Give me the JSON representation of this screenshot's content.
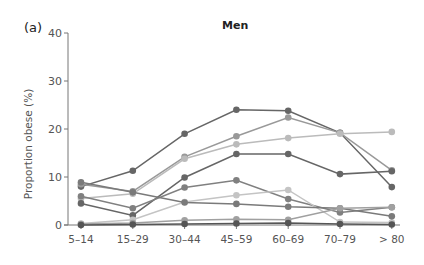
{
  "panel_label": "(a)",
  "chart_data": {
    "type": "line",
    "title": "Men",
    "xlabel": "",
    "ylabel": "Proportion obese (%)",
    "ylim": [
      0,
      40
    ],
    "yticks": [
      0,
      10,
      20,
      30,
      40
    ],
    "grid": false,
    "legend": null,
    "categories": [
      "5–14",
      "15–29",
      "30–44",
      "45–59",
      "60–69",
      "70–79",
      "> 80"
    ],
    "series": [
      {
        "name": "Series 1",
        "color": "#666666",
        "values": [
          8.0,
          11.3,
          19.0,
          24.0,
          23.8,
          19.2,
          7.9
        ]
      },
      {
        "name": "Series 2",
        "color": "#999999",
        "values": [
          8.5,
          7.0,
          14.2,
          18.5,
          22.4,
          19.2,
          11.4
        ]
      },
      {
        "name": "Series 3",
        "color": "#bbbbbb",
        "values": [
          5.5,
          6.5,
          13.8,
          16.8,
          18.1,
          19.0,
          19.4
        ]
      },
      {
        "name": "Series 4",
        "color": "#666666",
        "values": [
          4.5,
          2.0,
          9.9,
          14.8,
          14.8,
          10.6,
          11.2
        ]
      },
      {
        "name": "Series 5",
        "color": "#808080",
        "values": [
          6.0,
          3.5,
          7.8,
          9.3,
          5.4,
          2.6,
          3.7
        ]
      },
      {
        "name": "Series 6",
        "color": "#c4c4c4",
        "values": [
          0.3,
          1.1,
          4.8,
          6.2,
          7.3,
          0.6,
          0.5
        ]
      },
      {
        "name": "Series 7",
        "color": "#7a7a7a",
        "values": [
          8.9,
          6.8,
          4.7,
          4.4,
          3.8,
          3.5,
          1.8
        ]
      },
      {
        "name": "Series 8",
        "color": "#a0a0a0",
        "values": [
          0.2,
          0.4,
          1.0,
          1.2,
          1.1,
          3.5,
          3.7
        ]
      },
      {
        "name": "Series 9",
        "color": "#555555",
        "values": [
          0.0,
          0.1,
          0.2,
          0.3,
          0.4,
          0.2,
          0.1
        ]
      }
    ]
  }
}
